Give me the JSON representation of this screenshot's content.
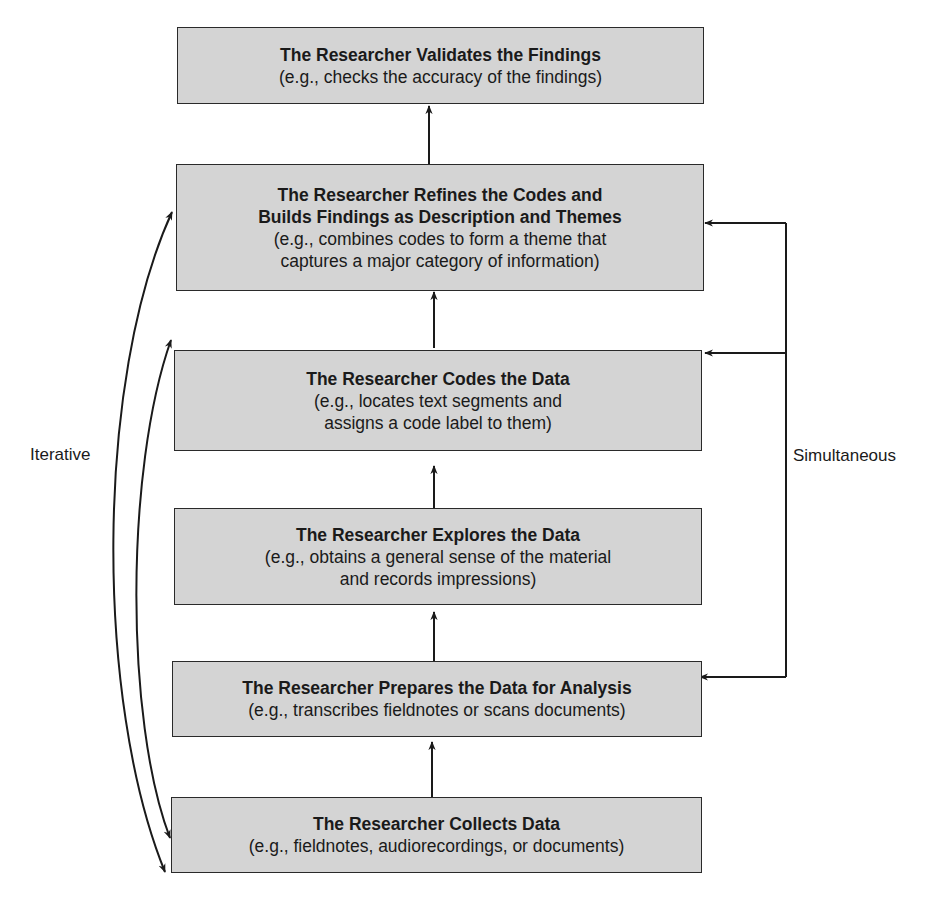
{
  "diagram": {
    "type": "flowchart",
    "direction": "bottom-to-top",
    "steps": [
      {
        "title": "The Researcher Validates the Findings",
        "desc": "(e.g., checks the accuracy of the findings)"
      },
      {
        "title": "The Researcher Refines the Codes and\nBuilds Findings as Description and Themes",
        "desc": "(e.g., combines codes to form a theme that\ncaptures a major category of information)"
      },
      {
        "title": "The Researcher Codes the Data",
        "desc": "(e.g., locates text segments and\nassigns a code label to them)"
      },
      {
        "title": "The Researcher Explores the Data",
        "desc": "(e.g., obtains a general sense of the material\nand records impressions)"
      },
      {
        "title": "The Researcher Prepares the Data for Analysis",
        "desc": "(e.g., transcribes fieldnotes or scans documents)"
      },
      {
        "title": "The Researcher Collects Data",
        "desc": "(e.g., fieldnotes, audiorecordings, or documents)"
      }
    ],
    "left_label": "Iterative",
    "right_label": "Simultaneous",
    "colors": {
      "box_fill": "#d4d4d4",
      "box_border": "#2a2a2a",
      "line": "#1a1a1a",
      "background": "#ffffff"
    }
  }
}
